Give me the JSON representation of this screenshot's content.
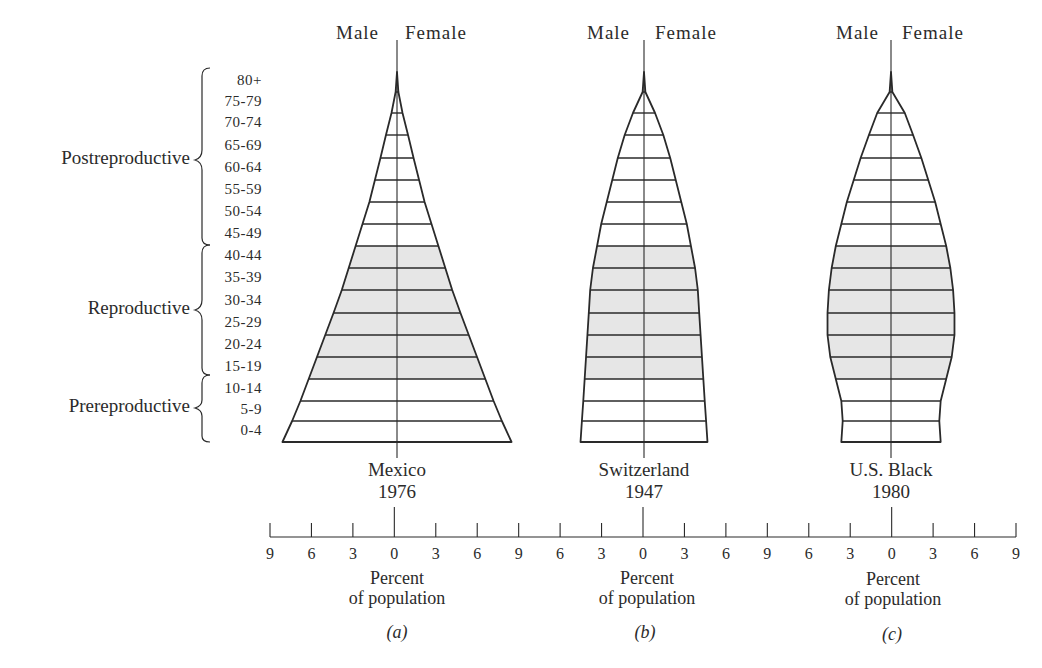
{
  "figure": {
    "sex_labels": {
      "male": "Male",
      "female": "Female"
    },
    "age_groups": [
      "80+",
      "75-79",
      "70-74",
      "65-69",
      "60-64",
      "55-59",
      "50-54",
      "45-49",
      "40-44",
      "35-39",
      "30-34",
      "25-29",
      "20-24",
      "15-19",
      "10-14",
      "5-9",
      "0-4"
    ],
    "stages": [
      {
        "label": "Postreproductive",
        "ages": "45-49 to 80+"
      },
      {
        "label": "Reproductive",
        "ages": "15-19 to 40-44"
      },
      {
        "label": "Prereproductive",
        "ages": "0-4 to 10-14"
      }
    ],
    "panels": [
      {
        "country": "Mexico",
        "year": "1976",
        "xlabel_line1": "Percent",
        "xlabel_line2": "of population",
        "panel_label": "(a)"
      },
      {
        "country": "Switzerland",
        "year": "1947",
        "xlabel_line1": "Percent",
        "xlabel_line2": "of population",
        "panel_label": "(b)"
      },
      {
        "country": "U.S. Black",
        "year": "1980",
        "xlabel_line1": "Percent",
        "xlabel_line2": "of population",
        "panel_label": "(c)"
      }
    ],
    "axis_ticks": [
      "9",
      "6",
      "3",
      "0",
      "3",
      "6",
      "9",
      "6",
      "3",
      "0",
      "3",
      "6",
      "9",
      "6",
      "3",
      "0",
      "3",
      "6",
      "9"
    ],
    "colors": {
      "line": "#2a2a2a",
      "reproductive_fill": "#e6e6e6",
      "background": "#ffffff"
    }
  },
  "chart_data": {
    "type": "bar",
    "subtype": "population-pyramid",
    "categories": [
      "0-4",
      "5-9",
      "10-14",
      "15-19",
      "20-24",
      "25-29",
      "30-34",
      "35-39",
      "40-44",
      "45-49",
      "50-54",
      "55-59",
      "60-64",
      "65-69",
      "70-74",
      "75-79",
      "80+"
    ],
    "xlabel": "Percent of population",
    "xlim": [
      -9,
      9
    ],
    "xticks": [
      9,
      6,
      3,
      0,
      3,
      6,
      9
    ],
    "shaded_group": "Reproductive (15-19 to 40-44)",
    "series_note": "Values are approximate half-widths (percent per sex) read from outline shapes; male and female symmetric",
    "pyramids": [
      {
        "name": "Mexico 1976",
        "panel": "(a)",
        "male": [
          8.3,
          7.6,
          7.0,
          6.4,
          5.8,
          5.2,
          4.6,
          4.0,
          3.5,
          3.0,
          2.5,
          2.0,
          1.6,
          1.2,
          0.8,
          0.4,
          0.1
        ],
        "female": [
          8.3,
          7.6,
          7.0,
          6.4,
          5.8,
          5.2,
          4.6,
          4.0,
          3.5,
          3.0,
          2.5,
          2.0,
          1.6,
          1.2,
          0.8,
          0.4,
          0.1
        ]
      },
      {
        "name": "Switzerland 1947",
        "panel": "(b)",
        "male": [
          4.6,
          4.5,
          4.4,
          4.3,
          4.2,
          4.1,
          4.0,
          3.9,
          3.7,
          3.4,
          3.1,
          2.7,
          2.3,
          1.9,
          1.4,
          0.8,
          0.1
        ],
        "female": [
          4.6,
          4.5,
          4.4,
          4.3,
          4.2,
          4.1,
          4.0,
          3.9,
          3.7,
          3.4,
          3.1,
          2.7,
          2.3,
          1.9,
          1.4,
          0.8,
          0.1
        ]
      },
      {
        "name": "U.S. Black 1980",
        "panel": "(c)",
        "male": [
          3.6,
          3.5,
          3.6,
          4.0,
          4.4,
          4.6,
          4.6,
          4.5,
          4.3,
          4.0,
          3.6,
          3.2,
          2.7,
          2.2,
          1.6,
          1.0,
          0.1
        ],
        "female": [
          3.6,
          3.5,
          3.6,
          4.0,
          4.4,
          4.6,
          4.6,
          4.5,
          4.3,
          4.0,
          3.6,
          3.2,
          2.7,
          2.2,
          1.6,
          1.0,
          0.1
        ]
      }
    ]
  }
}
